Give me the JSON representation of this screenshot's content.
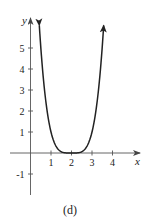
{
  "chart_data": {
    "type": "line",
    "title": "",
    "caption": "(d)",
    "xlabel": "x",
    "ylabel": "y",
    "function": "y = (x - 2)^4",
    "xlim": [
      -0.9,
      5.2
    ],
    "ylim": [
      -2,
      6.4
    ],
    "x_ticks": [
      1,
      2,
      3,
      4
    ],
    "x_tick_labels": [
      "1",
      "2",
      "3",
      "4"
    ],
    "y_ticks": [
      -1,
      1,
      2,
      3,
      4,
      5
    ],
    "y_tick_labels": [
      "-1",
      "1",
      "2",
      "3",
      "4",
      "5"
    ],
    "grid": false,
    "legend": null,
    "series": [
      {
        "name": "curve",
        "color": "#222222",
        "arrows_at_ends": true,
        "x": [
          0.43,
          0.6,
          0.8,
          1.0,
          1.2,
          1.4,
          1.6,
          1.8,
          2.0,
          2.2,
          2.4,
          2.6,
          2.8,
          3.0,
          3.2,
          3.4,
          3.57
        ],
        "y": [
          6.07,
          3.84,
          2.07,
          1.0,
          0.41,
          0.13,
          0.03,
          0.0,
          0.0,
          0.0,
          0.03,
          0.13,
          0.41,
          1.0,
          2.07,
          3.84,
          6.07
        ]
      }
    ]
  }
}
